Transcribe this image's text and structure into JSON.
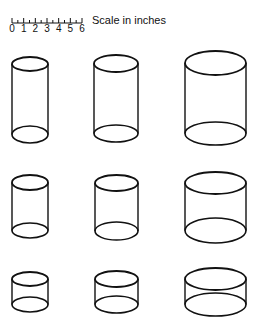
{
  "scale": {
    "label": "Scale in inches",
    "ticks": [
      "0",
      "1",
      "2",
      "3",
      "4",
      "5",
      "6"
    ],
    "x0": 12,
    "x1": 82,
    "y": 23
  },
  "stroke_color": "#111111",
  "cylinders": [
    {
      "id": "row1-col1",
      "x0": 12,
      "x1": 48,
      "top_y0": 57,
      "top_y1": 71,
      "bot_y0": 126,
      "bot_y1": 143
    },
    {
      "id": "row1-col2",
      "x0": 94,
      "x1": 138,
      "top_y0": 55,
      "top_y1": 72,
      "bot_y0": 125,
      "bot_y1": 142
    },
    {
      "id": "row1-col3",
      "x0": 185,
      "x1": 246,
      "top_y0": 51,
      "top_y1": 75,
      "bot_y0": 122,
      "bot_y1": 145
    },
    {
      "id": "row2-col1",
      "x0": 12,
      "x1": 48,
      "top_y0": 175,
      "top_y1": 190,
      "bot_y0": 223,
      "bot_y1": 238
    },
    {
      "id": "row2-col2",
      "x0": 95,
      "x1": 138,
      "top_y0": 175,
      "top_y1": 191,
      "bot_y0": 222,
      "bot_y1": 240
    },
    {
      "id": "row2-col3",
      "x0": 185,
      "x1": 246,
      "top_y0": 172,
      "top_y1": 194,
      "bot_y0": 218,
      "bot_y1": 243
    },
    {
      "id": "row3-col1",
      "x0": 12,
      "x1": 48,
      "top_y0": 272,
      "top_y1": 286,
      "bot_y0": 297,
      "bot_y1": 312
    },
    {
      "id": "row3-col2",
      "x0": 95,
      "x1": 138,
      "top_y0": 271,
      "top_y1": 287,
      "bot_y0": 296,
      "bot_y1": 313
    },
    {
      "id": "row3-col3",
      "x0": 185,
      "x1": 246,
      "top_y0": 268,
      "top_y1": 290,
      "bot_y0": 293,
      "bot_y1": 316
    }
  ]
}
